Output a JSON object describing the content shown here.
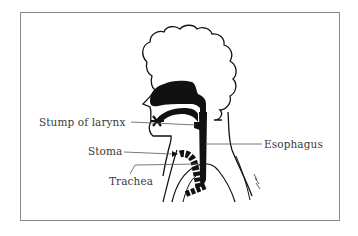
{
  "diagram": {
    "type": "anatomical-cross-section",
    "labels": {
      "stump_of_larynx": "Stump of larynx",
      "stoma": "Stoma",
      "trachea": "Trachea",
      "esophagus": "Esophagus"
    },
    "colors": {
      "ink": "#111111",
      "leader_line": "#555555",
      "label_text": "#3a3a3a",
      "frame": "#8a8a8a",
      "background": "#ffffff"
    }
  }
}
